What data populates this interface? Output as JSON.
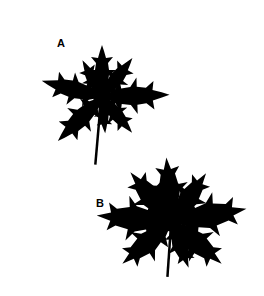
{
  "figure": {
    "panels": [
      {
        "label": "A",
        "description": "leaf silhouette A"
      },
      {
        "label": "B",
        "description": "leaf silhouette B"
      }
    ],
    "colors": {
      "background": "#ffffff",
      "silhouette": "#000000"
    }
  }
}
